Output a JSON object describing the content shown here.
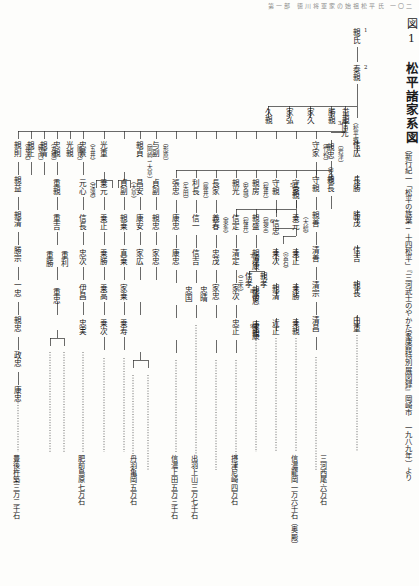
{
  "page": {
    "running_head": "第一部 徳川将軍家の始祖松平氏   一〇二",
    "width": 419,
    "height": 586
  },
  "figure": {
    "number": "図1",
    "name": "松平諸家系図",
    "source": "（新行紀一「松平の族葉─十四松平」『三河武士のやかた家康館特別展図録』岡崎市　一九八九年）より"
  },
  "legend": {
    "generation_marker_note": "数字は当主の代数",
    "branch_bracket_note": "〔　〕内は分家名"
  },
  "main_line": {
    "label": "松平宗家",
    "members": [
      {
        "gen": "1",
        "name": "親氏"
      },
      {
        "gen": "2",
        "name": "泰親"
      },
      {
        "gen": "3",
        "name": "信光",
        "branch": "（松平郷）"
      },
      {
        "gen": "4",
        "name": "親忠",
        "branch": "（安城）"
      },
      {
        "gen": "5",
        "name": "長親"
      },
      {
        "gen": "6",
        "name": "信忠"
      },
      {
        "gen": "7",
        "name": "清康"
      },
      {
        "gen": "8",
        "name": "広忠"
      },
      {
        "gen": "9",
        "name": "家康"
      }
    ]
  },
  "columns": [
    {
      "id": "col-matsudaira-go",
      "branch": "（松平郷）",
      "names": [
        "信広",
        "長勝",
        "勝茂",
        "信吉",
        "親長",
        "由重",
        "尚栄"
      ]
    },
    {
      "id": "col-iwatsu",
      "branch": "〔岩津〕",
      "names": [
        "親長",
        "親長",
        "親長"
      ]
    },
    {
      "id": "col-takeya",
      "branch": "〔竹谷〕",
      "names": [
        "守家",
        "守親",
        "親善",
        "清善",
        "清宗",
        "清昌",
        "清直"
      ]
    },
    {
      "id": "col-ogyu",
      "branch": "〔大給〕",
      "names": [
        "乗元",
        "乗正",
        "乗勝",
        "乗親",
        "親乗",
        "真乗",
        "家乗"
      ]
    },
    {
      "id": "col-miyaishi",
      "branch": "（宮石）",
      "names": [
        "乗次",
        "親清",
        "近正",
        "近正"
      ]
    },
    {
      "id": "col-fukozu",
      "branch": "〔深溝〕",
      "names": [
        "忠定",
        "好景",
        "伊忠",
        "家忠",
        "忠利",
        "忠房",
        "忠雄",
        "忠俔"
      ]
    },
    {
      "id": "col-gojo",
      "branch": "（五井）",
      "names": [
        "元心",
        "信長",
        "忠次",
        "伊昌",
        "忠実"
      ]
    },
    {
      "id": "col-nogi",
      "branch": "〔能見〕",
      "names": [
        "重親",
        "重吉",
        "重勝",
        "重利",
        "重忠",
        "昌利"
      ]
    },
    {
      "id": "col-marune",
      "branch": "〔丸根〕",
      "names": [
        "親清",
        "親孝",
        "親次"
      ]
    },
    {
      "id": "col-makiuchi",
      "branch": "〔牧内〕",
      "names": [
        "親正",
        "親清"
      ]
    },
    {
      "id": "col-nagasawa",
      "branch": "〔長沢〕",
      "names": [
        "親則",
        "親益",
        "親清",
        "勝宗",
        "一忠",
        "親忠",
        "政忠",
        "康忠",
        "康直"
      ]
    },
    {
      "id": "col-okazaki",
      "branch": "〔岡崎→大草〕",
      "names": [
        "親貞",
        "昌安",
        "康安",
        "家広"
      ]
    },
    {
      "id": "col-katahara",
      "branch": "〔形原〕",
      "names": [
        "与副",
        "貞副",
        "親忠",
        "家忠",
        "家信",
        "家忠"
      ]
    },
    {
      "id": "col-yada",
      "branch": "〔矢田〕",
      "names": [
        "張忠",
        "康忠",
        "康忠"
      ]
    },
    {
      "id": "col-fujii",
      "branch": "〔藤井〕",
      "names": [
        "利長",
        "信一",
        "信吉",
        "忠国",
        "忠晴"
      ]
    },
    {
      "id": "col-tojo",
      "branch": "（東条）",
      "names": [
        "義春",
        "忠茂",
        "家忠"
      ]
    },
    {
      "id": "col-sakurai",
      "branch": "〔桜井〕",
      "names": [
        "信定",
        "清定",
        "家次",
        "忠正"
      ]
    },
    {
      "id": "col-fukama",
      "branch": "〔福釜〕",
      "names": [
        "親盛",
        "親次",
        "親俊",
        "康親"
      ]
    },
    {
      "id": "col-hachiman",
      "branch": "（三木）",
      "names": [
        "信孝",
        "清康"
      ]
    }
  ],
  "fiefs": [
    {
      "id": "fief-hizen-shimabara",
      "label": "肥前島原七万石"
    },
    {
      "id": "fief-bungo-kitsuki",
      "label": "豊後杵築三万二千石"
    },
    {
      "id": "fief-tanba-kameoka",
      "label": "丹羽亀岡五万石"
    },
    {
      "id": "fief-dewa-kaminoyama",
      "label": "出羽上山三万七千石"
    },
    {
      "id": "fief-shinano-ueda",
      "label": "信濃上田五万三千石"
    },
    {
      "id": "fief-settsu-amagasaki",
      "label": "摂津尼崎四万石"
    },
    {
      "id": "fief-shinano-tatsuoka",
      "label": "信濃龍岡一万六千石（奥殿）"
    },
    {
      "id": "fief-mikawa-nishio",
      "label": "三河西尾六万石"
    }
  ],
  "colors": {
    "ink": "#1b1b1b",
    "rule": "#2b2b2b",
    "paper": "#fdfdfb",
    "faint": "#8d8d8d"
  }
}
